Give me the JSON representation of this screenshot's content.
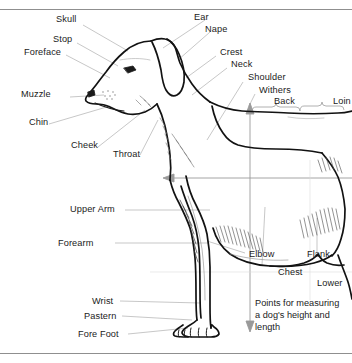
{
  "figure": {
    "type": "anatomical-line-diagram",
    "subject": "dog",
    "view": "left side profile",
    "background_color": "#ffffff",
    "ink_color": "#1a1a1a",
    "leader_line_color": "#b0b0b0",
    "measure_arrow_color": "#9a9a9a",
    "border_rule_color": "#9a9a9a"
  },
  "labels": {
    "skull": "Skull",
    "stop": "Stop",
    "foreface": "Foreface",
    "muzzle": "Muzzle",
    "chin": "Chin",
    "cheek": "Cheek",
    "throat": "Throat",
    "ear": "Ear",
    "nape": "Nape",
    "crest": "Crest",
    "neck": "Neck",
    "shoulder": "Shoulder",
    "withers": "Withers",
    "back": "Back",
    "loin": "Loin",
    "upper_arm": "Upper Arm",
    "forearm": "Forearm",
    "wrist": "Wrist",
    "pastern": "Pastern",
    "fore_foot": "Fore Foot",
    "elbow": "Elbow",
    "chest": "Chest",
    "flank": "Flank",
    "lower": "Lower"
  },
  "caption": {
    "line1": "Points for measuring",
    "line2": "a dog's height and",
    "line3": "length"
  }
}
